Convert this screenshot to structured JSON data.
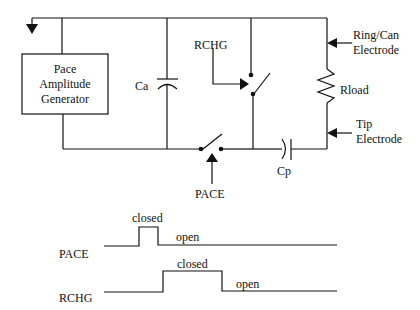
{
  "diagram": {
    "generator": {
      "line1": "Pace",
      "line2": "Amplitude",
      "line3": "Generator"
    },
    "components": {
      "ca": "Ca",
      "cp": "Cp",
      "rload": "Rload",
      "rchg": "RCHG",
      "pace": "PACE"
    },
    "electrodes": {
      "ring_line1": "Ring/Can",
      "ring_line2": "Electrode",
      "tip_line1": "Tip",
      "tip_line2": "Electrode"
    }
  },
  "timing": {
    "pace": {
      "label": "PACE",
      "closed": "closed",
      "open": "open"
    },
    "rchg": {
      "label": "RCHG",
      "closed": "closed",
      "open": "open"
    }
  },
  "colors": {
    "line": "#111111",
    "background": "#ffffff"
  }
}
